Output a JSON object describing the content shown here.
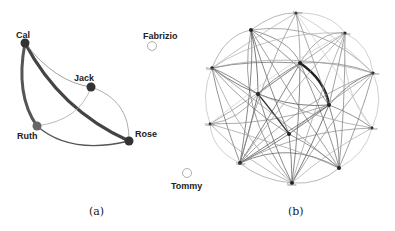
{
  "figure": {
    "captions": {
      "a": "(a)",
      "b": "(b)"
    }
  },
  "panel_a": {
    "nodes": [
      {
        "id": "cal",
        "label": "Cal",
        "x": 25,
        "y": 43,
        "filled": true,
        "color": "#333333"
      },
      {
        "id": "jack",
        "label": "Jack",
        "x": 91,
        "y": 87,
        "filled": true,
        "color": "#333333"
      },
      {
        "id": "ruth",
        "label": "Ruth",
        "x": 37,
        "y": 126,
        "filled": true,
        "color": "#666666"
      },
      {
        "id": "rose",
        "label": "Rose",
        "x": 129,
        "y": 141,
        "filled": true,
        "color": "#333333"
      },
      {
        "id": "fabrizio",
        "label": "Fabrizio",
        "x": 152,
        "y": 46,
        "filled": false,
        "color": "#999999"
      },
      {
        "id": "tommy",
        "label": "Tommy",
        "x": 187,
        "y": 173,
        "filled": false,
        "color": "#999999"
      }
    ],
    "edges": [
      {
        "from": "cal",
        "to": "rose",
        "weight": "heavy"
      },
      {
        "from": "cal",
        "to": "ruth",
        "weight": "heavy"
      },
      {
        "from": "cal",
        "to": "jack",
        "weight": "light"
      },
      {
        "from": "jack",
        "to": "rose",
        "weight": "light"
      },
      {
        "from": "jack",
        "to": "ruth",
        "weight": "light"
      },
      {
        "from": "ruth",
        "to": "rose",
        "weight": "medium"
      }
    ]
  },
  "panel_b": {
    "nodes": [
      {
        "id": "n1",
        "label": "Name",
        "x": 296,
        "y": 13
      },
      {
        "id": "n2",
        "label": "",
        "x": 251,
        "y": 30
      },
      {
        "id": "n3",
        "label": "Name",
        "x": 345,
        "y": 33
      },
      {
        "id": "n4",
        "label": "Name",
        "x": 212,
        "y": 68
      },
      {
        "id": "n5",
        "label": "",
        "x": 300,
        "y": 63
      },
      {
        "id": "n6",
        "label": "Name",
        "x": 373,
        "y": 73
      },
      {
        "id": "n7",
        "label": "",
        "x": 258,
        "y": 94
      },
      {
        "id": "n8",
        "label": "",
        "x": 329,
        "y": 105
      },
      {
        "id": "n9",
        "label": "Name",
        "x": 210,
        "y": 124
      },
      {
        "id": "n10",
        "label": "Name",
        "x": 372,
        "y": 128
      },
      {
        "id": "n11",
        "label": "",
        "x": 289,
        "y": 134
      },
      {
        "id": "n12",
        "label": "Name",
        "x": 240,
        "y": 163
      },
      {
        "id": "n13",
        "label": "",
        "x": 339,
        "y": 168
      },
      {
        "id": "n14",
        "label": "Name",
        "x": 292,
        "y": 183
      }
    ]
  }
}
